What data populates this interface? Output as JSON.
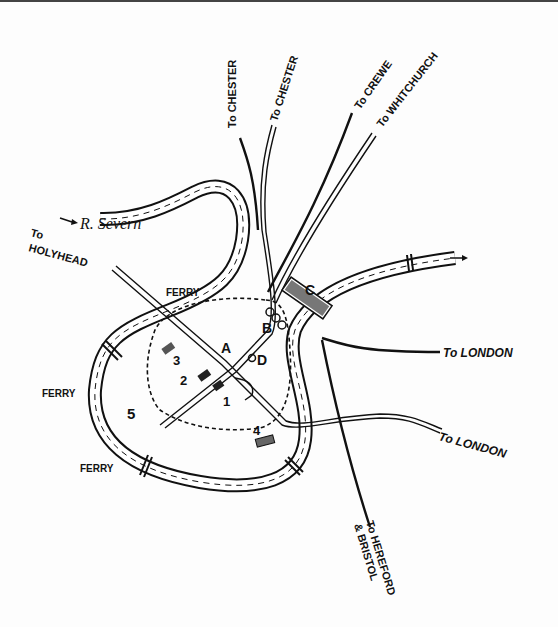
{
  "map": {
    "river": {
      "name": "R. Severn"
    },
    "routes": {
      "chester_1": "To CHESTER",
      "chester_2": "To CHESTER",
      "crewe": "To CREWE",
      "whitchurch": "To WHITCHURCH",
      "holyhead_1": "To",
      "holyhead_2": "HOLYHEAD",
      "london_east": "To LONDON",
      "london_se": "To LONDON",
      "hereford_1": "To HEREFORD",
      "hereford_2": "& BRISTOL"
    },
    "ferries": [
      "FERRY",
      "FERRY",
      "FERRY"
    ],
    "points": [
      "A",
      "B",
      "C",
      "D"
    ],
    "numbers": [
      "1",
      "2",
      "3",
      "4",
      "5"
    ]
  }
}
